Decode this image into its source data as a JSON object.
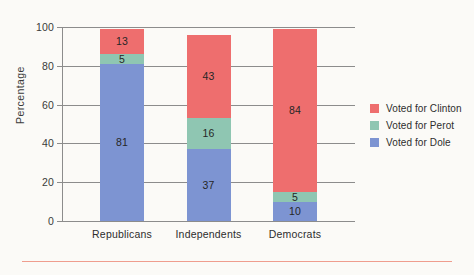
{
  "chart_data": {
    "type": "bar",
    "subtype": "stacked-vertical",
    "title": "",
    "xlabel": "",
    "ylabel": "Percentage",
    "ylim": [
      0,
      100
    ],
    "yticks": [
      0,
      20,
      40,
      60,
      80,
      100
    ],
    "ytick_labels": [
      "0",
      "20",
      "40",
      "60",
      "80",
      "100"
    ],
    "grid": true,
    "legend_position": "right",
    "categories": [
      "Republicans",
      "Independents",
      "Democrats"
    ],
    "series": [
      {
        "name": "Voted for Clinton",
        "color": "#ee6e6e",
        "values": [
          13,
          43,
          84
        ]
      },
      {
        "name": "Voted for Perot",
        "color": "#8fc6b2",
        "values": [
          5,
          16,
          5
        ]
      },
      {
        "name": "Voted for Dole",
        "color": "#7d94d2",
        "values": [
          81,
          37,
          10
        ]
      }
    ],
    "stack_order_bottom_to_top": [
      "Voted for Dole",
      "Voted for Perot",
      "Voted for Clinton"
    ],
    "totals": [
      99,
      96,
      99
    ],
    "data_labels_shown": true,
    "bars": [
      {
        "category": "Republicans",
        "segments": [
          {
            "series": "Voted for Dole",
            "value": 81,
            "label": "81",
            "color": "#7d94d2"
          },
          {
            "series": "Voted for Perot",
            "value": 5,
            "label": "5",
            "color": "#8fc6b2"
          },
          {
            "series": "Voted for Clinton",
            "value": 13,
            "label": "13",
            "color": "#ee6e6e"
          }
        ]
      },
      {
        "category": "Independents",
        "segments": [
          {
            "series": "Voted for Dole",
            "value": 37,
            "label": "37",
            "color": "#7d94d2"
          },
          {
            "series": "Voted for Perot",
            "value": 16,
            "label": "16",
            "color": "#8fc6b2"
          },
          {
            "series": "Voted for Clinton",
            "value": 43,
            "label": "43",
            "color": "#ee6e6e"
          }
        ]
      },
      {
        "category": "Democrats",
        "segments": [
          {
            "series": "Voted for Dole",
            "value": 10,
            "label": "10",
            "color": "#7d94d2"
          },
          {
            "series": "Voted for Perot",
            "value": 5,
            "label": "5",
            "color": "#8fc6b2"
          },
          {
            "series": "Voted for Clinton",
            "value": 84,
            "label": "84",
            "color": "#ee6e6e"
          }
        ]
      }
    ]
  },
  "style": {
    "background": "#fbfaf7",
    "grid_color": "#8c8c8c",
    "text_color": "#2d2d2d",
    "rule_color": "#ef9d8e"
  }
}
